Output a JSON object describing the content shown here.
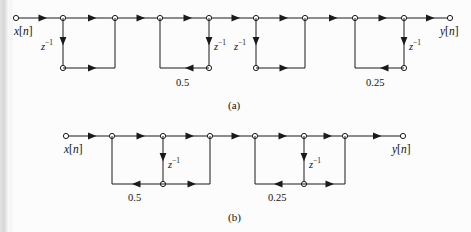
{
  "figure": {
    "background_color": "#fcfcfc",
    "line_color": "#1a1a1a",
    "node_fill": "#ffffff"
  },
  "diagrams": [
    {
      "caption": "(a)",
      "caption_pos": {
        "x": 228,
        "y": 100
      },
      "input_label": "x[n]",
      "output_label": "y[n]",
      "input_label_pos": {
        "x": 14,
        "y": 26
      },
      "output_label_pos": {
        "x": 440,
        "y": 26
      },
      "top_y": 18,
      "bottom_y": 68,
      "input_node_x": 16,
      "output_node_x": 450,
      "sections": [
        {
          "name": "section-1",
          "left_x": 63,
          "right_x": 115,
          "delay_label": "z⁻¹",
          "delay_side": "left",
          "delay_label_pos": {
            "x": 41,
            "y": 39
          },
          "bottom_arrow_dir": "right",
          "gain_label": "",
          "gain_label_pos": null
        },
        {
          "name": "section-2",
          "left_x": 160,
          "right_x": 209,
          "delay_label": "z⁻¹",
          "delay_side": "right",
          "delay_label_pos": {
            "x": 214,
            "y": 39
          },
          "bottom_arrow_dir": "left",
          "gain_label": "0.5",
          "gain_label_pos": {
            "x": 176,
            "y": 78
          }
        },
        {
          "name": "section-3",
          "left_x": 256,
          "right_x": 305,
          "delay_label": "z⁻¹",
          "delay_side": "left",
          "delay_label_pos": {
            "x": 234,
            "y": 39
          },
          "bottom_arrow_dir": "right",
          "gain_label": "",
          "gain_label_pos": null
        },
        {
          "name": "section-4",
          "left_x": 355,
          "right_x": 404,
          "delay_label": "z⁻¹",
          "delay_side": "right",
          "delay_label_pos": {
            "x": 409,
            "y": 39
          },
          "bottom_arrow_dir": "left",
          "gain_label": "0.25",
          "gain_label_pos": {
            "x": 366,
            "y": 78
          }
        }
      ]
    },
    {
      "caption": "(b)",
      "caption_pos": {
        "x": 228,
        "y": 212
      },
      "input_label": "x[n]",
      "output_label": "y[n]",
      "input_label_pos": {
        "x": 64,
        "y": 144
      },
      "output_label_pos": {
        "x": 392,
        "y": 144
      },
      "top_y": 136,
      "bottom_y": 184,
      "input_node_x": 66,
      "output_node_x": 403,
      "sections": [
        {
          "name": "section-1",
          "left_x": 112,
          "mid_x": 163,
          "right_x": 210,
          "delay_label": "z⁻¹",
          "delay_label_pos": {
            "x": 168,
            "y": 157
          },
          "gain_label": "0.5",
          "gain_label_pos": {
            "x": 128,
            "y": 193
          }
        },
        {
          "name": "section-2",
          "left_x": 255,
          "mid_x": 304,
          "right_x": 345,
          "delay_label": "z⁻¹",
          "delay_label_pos": {
            "x": 309,
            "y": 157
          },
          "gain_label": "0.25",
          "gain_label_pos": {
            "x": 268,
            "y": 193
          }
        }
      ]
    }
  ]
}
